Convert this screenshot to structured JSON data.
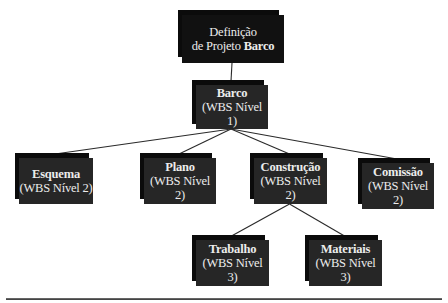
{
  "diagram": {
    "type": "work-breakdown-structure",
    "root": {
      "line1": "Definição",
      "line2_prefix": "de Projeto ",
      "line2_bold": "Barco"
    },
    "nodes": [
      {
        "id": "barco",
        "title": "Barco",
        "subtitle": "(WBS Nível 1)",
        "parent": "root"
      },
      {
        "id": "esquema",
        "title": "Esquema",
        "subtitle": "(WBS Nível 2)",
        "parent": "barco"
      },
      {
        "id": "plano",
        "title": "Plano",
        "subtitle": "(WBS Nível 2)",
        "parent": "barco"
      },
      {
        "id": "construcao",
        "title": "Construção",
        "subtitle": "(WBS Nível 2)",
        "parent": "barco"
      },
      {
        "id": "comissao",
        "title": "Comissão",
        "subtitle": "(WBS Nível 2)",
        "parent": "barco"
      },
      {
        "id": "trabalho",
        "title": "Trabalho",
        "subtitle": "(WBS Nível 3)",
        "parent": "construcao"
      },
      {
        "id": "materiais",
        "title": "Materiais",
        "subtitle": "(WBS Nível 3)",
        "parent": "construcao"
      }
    ],
    "colors": {
      "box_front": "#262626",
      "box_back": "#0b0b0b",
      "text": "#ececec",
      "connector": "#2a2a2a",
      "background": "#ffffff"
    }
  }
}
